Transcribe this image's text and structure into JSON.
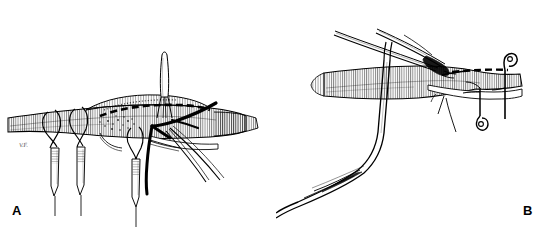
{
  "figure": {
    "background_color": "#ffffff",
    "ink_color": "#000000",
    "panel_count": 2,
    "style": "black-and-white pen-and-ink line drawing"
  },
  "panels": [
    {
      "id": "A",
      "label": "A",
      "caption_text": "",
      "signature": "V.F.",
      "description": "Longitudinal vessel with arteriotomy closed by a running dashed suture line; three stay sutures looped around the vessel and held by serrated hemostat clamps hanging below; a fine needle holder stands vertically above the suture line; heavy black suture strands and fine forceps tips extend to the right.",
      "elements": [
        {
          "name": "vessel",
          "kind": "anatomy",
          "note": "horizontal tubular vessel with fine vertical cross-hatching"
        },
        {
          "name": "suture-line",
          "kind": "suture",
          "note": "dashed running suture along vessel wall"
        },
        {
          "name": "stay-suture-loop-1",
          "kind": "suture",
          "note": "loop around vessel, left"
        },
        {
          "name": "stay-suture-loop-2",
          "kind": "suture",
          "note": "loop around vessel, left-center"
        },
        {
          "name": "stay-suture-loop-3",
          "kind": "suture",
          "note": "loop around vessel, center"
        },
        {
          "name": "hemostat-clamp-1",
          "kind": "instrument",
          "note": "serrated hemostat hanging from loop 1"
        },
        {
          "name": "hemostat-clamp-2",
          "kind": "instrument",
          "note": "serrated hemostat hanging from loop 2"
        },
        {
          "name": "hemostat-clamp-3",
          "kind": "instrument",
          "note": "serrated hemostat hanging from loop 3"
        },
        {
          "name": "needle-holder",
          "kind": "instrument",
          "note": "vertical fine-tipped needle holder above the anastomosis"
        },
        {
          "name": "black-suture-strand",
          "kind": "suture",
          "note": "heavy black thread crossing to upper right"
        },
        {
          "name": "forceps-tips",
          "kind": "instrument",
          "note": "fine instrument tips angled to lower right"
        }
      ]
    },
    {
      "id": "B",
      "label": "B",
      "caption_text": "",
      "signature": "V.F.",
      "description": "Vessel held open with a long bent retractor passing beneath it; fine-tipped forceps approach the anastomosis from upper left; two hook retractors engage the vessel edge on the right, with a dashed suture line running along the wall.",
      "elements": [
        {
          "name": "vessel",
          "kind": "anatomy",
          "note": "horizontal tubular vessel with fine vertical cross-hatching"
        },
        {
          "name": "suture-line",
          "kind": "suture",
          "note": "dashed running suture along right portion of vessel"
        },
        {
          "name": "fine-forceps",
          "kind": "instrument",
          "note": "long slender forceps entering from upper left"
        },
        {
          "name": "bent-retractor",
          "kind": "instrument",
          "note": "large bent retractor curving down to lower left"
        },
        {
          "name": "hook-retractor-upper",
          "kind": "instrument",
          "note": "small hook engaging upper vessel edge"
        },
        {
          "name": "hook-retractor-lower",
          "kind": "instrument",
          "note": "small hook engaging lower vessel edge"
        },
        {
          "name": "suture-tail",
          "kind": "suture",
          "note": "thin suture tail hanging below vessel"
        }
      ]
    }
  ]
}
